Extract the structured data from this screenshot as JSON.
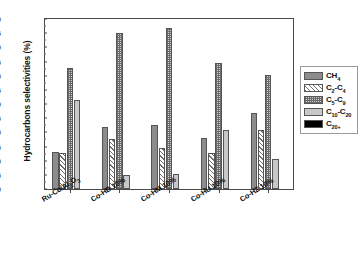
{
  "chart_data": {
    "type": "bar",
    "title": "",
    "xlabel": "",
    "ylabel": "Hydrocarbons selectivities (%)",
    "ylim": [
      0,
      60
    ],
    "ytick_step": 5,
    "yticks": [
      0,
      5,
      10,
      15,
      20,
      25,
      30,
      35,
      40,
      45,
      50,
      55,
      60
    ],
    "grid": false,
    "legend_position": "right",
    "categories": [
      "Ru-Co/Al₂O₃",
      "Co-HB 10%",
      "Co-HM 10%",
      "Co-HU 10%",
      "Co-HZ 10%"
    ],
    "series": [
      {
        "name": "CH₄",
        "values": [
          13.1,
          22.0,
          22.5,
          18.0,
          27.0
        ]
      },
      {
        "name": "C₂-C₄",
        "values": [
          12.6,
          17.6,
          14.3,
          12.8,
          21.0
        ]
      },
      {
        "name": "C₅-C₉",
        "values": [
          42.7,
          55.0,
          57.0,
          44.5,
          40.2
        ]
      },
      {
        "name": "C₁₀-C₂₀",
        "values": [
          31.5,
          4.9,
          5.3,
          21.0,
          10.5
        ]
      },
      {
        "name": "C₂₀₊",
        "values": [
          0,
          0,
          0,
          0,
          0
        ]
      }
    ]
  },
  "axes": {
    "y_title": "Hydrocarbons selectivities (%)",
    "y_tick_labels": [
      "0",
      "5",
      "10",
      "15",
      "20",
      "25",
      "30",
      "35",
      "40",
      "45",
      "50",
      "55",
      "60"
    ],
    "x_tick_labels": [
      "Ru-Co/Al₂O₃",
      "Co-HB 10%",
      "Co-HM 10%",
      "Co-HU 10%",
      "Co-HZ 10%"
    ]
  },
  "legend": {
    "entries": [
      {
        "label": "CH₄",
        "pattern": "solid-gray",
        "color": "#8c8c8c"
      },
      {
        "label": "C₂-C₄",
        "pattern": "diagonal-hatch",
        "color": "#6f6f6f"
      },
      {
        "label": "C₅-C₉",
        "pattern": "checkered",
        "color": "#6b6b6b"
      },
      {
        "label": "C₁₀-C₂₀",
        "pattern": "solid-light-gray",
        "color": "#c8c8c8"
      },
      {
        "label": "C₂₀₊",
        "pattern": "solid-black",
        "color": "#000000"
      }
    ]
  },
  "colors": {
    "axis": "#4a4a4a",
    "text": "#111111",
    "background": "#ffffff"
  }
}
